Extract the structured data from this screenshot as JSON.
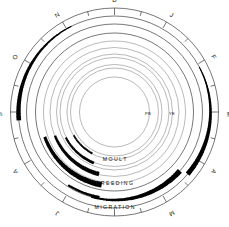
{
  "figure": {
    "name": "annual-cycle-diagram",
    "cx": 114.5,
    "cy": 112.0,
    "accent_color": "#000000",
    "ring_color": "#4a4a4a"
  },
  "months": [
    {
      "label": "D",
      "angle": 270
    },
    {
      "label": "J",
      "angle": 300
    },
    {
      "label": "F",
      "angle": 330
    },
    {
      "label": "M",
      "angle": 0
    },
    {
      "label": "A",
      "angle": 30
    },
    {
      "label": "M",
      "angle": 60
    },
    {
      "label": "J",
      "angle": 90
    },
    {
      "label": "J",
      "angle": 120
    },
    {
      "label": "A",
      "angle": 150
    },
    {
      "label": "S",
      "angle": 180
    },
    {
      "label": "O",
      "angle": 210
    },
    {
      "label": "N",
      "angle": 240
    }
  ],
  "band_labels": [
    {
      "id": "moult",
      "text": "M O U L T",
      "x": 114.5,
      "y": 160.5
    },
    {
      "id": "breeding",
      "text": "B R E E D I N G",
      "x": 114.5,
      "y": 185.0
    },
    {
      "id": "migration",
      "text": "M I G R A T I O N",
      "x": 114.5,
      "y": 208.5
    }
  ],
  "inner_labels": [
    {
      "id": "pb",
      "text": "PB",
      "x": 148.0,
      "y": 115.0
    },
    {
      "id": "ye",
      "text": "YE",
      "x": 172.0,
      "y": 115.0
    }
  ],
  "chart_data": {
    "type": "polar-band",
    "angular_axis": {
      "unit": "month",
      "direction": "counter-clockwise",
      "start_label": "D",
      "start_angle_deg": 270,
      "tick_count": 12,
      "tick_labels": [
        "D",
        "J",
        "F",
        "M",
        "A",
        "M",
        "J",
        "J",
        "A",
        "S",
        "O",
        "N"
      ]
    },
    "rings": [
      {
        "id": "outer-frame",
        "radius": 104.0,
        "kind": "frame",
        "stroke": 0.75
      },
      {
        "id": "migration",
        "radius": 96.0,
        "kind": "track",
        "stroke": 0.75
      },
      {
        "id": "breeding",
        "radius": 88.0,
        "kind": "track",
        "stroke": 0.75
      },
      {
        "id": "moult-outer",
        "radius": 79.0,
        "kind": "track",
        "stroke": 0.75
      },
      {
        "id": "ring-4",
        "radius": 71.0,
        "kind": "track",
        "stroke": 0.6
      },
      {
        "id": "ring-5",
        "radius": 64.5,
        "kind": "track",
        "stroke": 0.6
      },
      {
        "id": "ring-6",
        "radius": 58.0,
        "kind": "track",
        "stroke": 0.6
      },
      {
        "id": "ring-7",
        "radius": 54.5,
        "kind": "track",
        "stroke": 0.6
      },
      {
        "id": "ring-8",
        "radius": 47.5,
        "kind": "track",
        "stroke": 0.6
      },
      {
        "id": "ring-9",
        "radius": 44.0,
        "kind": "track",
        "stroke": 0.6
      },
      {
        "id": "inner-core",
        "radius": 35.0,
        "kind": "track",
        "stroke": 0.6
      }
    ],
    "series": [
      {
        "name": "migration-autumn",
        "ring": "migration",
        "radius": 96.0,
        "start_month": "S",
        "end_month": "N",
        "start_angle": 175,
        "end_angle": 243,
        "thickness_start": 4.6,
        "thickness_end": 1.0,
        "color": "#000000"
      },
      {
        "name": "migration-spring",
        "ring": "migration",
        "radius": 96.0,
        "start_month": "F",
        "end_month": "A",
        "start_angle": 332,
        "end_angle": 40,
        "thickness_start": 1.0,
        "thickness_end": 5.0,
        "color": "#000000"
      },
      {
        "name": "breeding-main",
        "ring": "breeding",
        "radius": 88.0,
        "start_month": "M",
        "end_month": "J",
        "start_angle": 42,
        "end_angle": 105,
        "thickness_start": 5.4,
        "thickness_end": 1.6,
        "color": "#000000"
      },
      {
        "name": "breeding-tail",
        "ring": "breeding",
        "radius": 86.5,
        "start_month": "J",
        "end_month": "J",
        "start_angle": 100,
        "end_angle": 122,
        "thickness_start": 2.6,
        "thickness_end": 2.0,
        "color": "#000000"
      },
      {
        "name": "moult-main",
        "ring": "moult-outer",
        "radius": 74.0,
        "start_month": "J",
        "end_month": "A",
        "start_angle": 100,
        "end_angle": 160,
        "thickness_start": 5.6,
        "thickness_end": 3.0,
        "color": "#000000"
      },
      {
        "name": "moult-secondary",
        "ring": "ring-4",
        "radius": 64.0,
        "start_month": "J",
        "end_month": "A",
        "start_angle": 104,
        "end_angle": 158,
        "thickness_start": 4.4,
        "thickness_end": 2.4,
        "color": "#000000"
      },
      {
        "name": "moult-inner",
        "ring": "ring-6",
        "radius": 55.0,
        "start_month": "J",
        "end_month": "A",
        "start_angle": 112,
        "end_angle": 152,
        "thickness_start": 2.8,
        "thickness_end": 2.0,
        "color": "#000000"
      },
      {
        "name": "post-breeding-pb",
        "ring": "ring-8",
        "radius": 47.0,
        "start_month": "J",
        "end_month": "A",
        "start_angle": 118,
        "end_angle": 150,
        "thickness_start": 2.0,
        "thickness_end": 1.6,
        "color": "#000000"
      }
    ]
  }
}
